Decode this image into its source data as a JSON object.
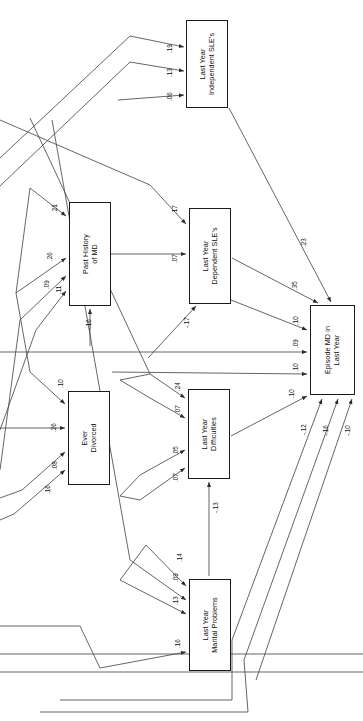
{
  "figure": {
    "orientation": "rotated-90-ccw",
    "type": "path-diagram",
    "background": "#ffffff",
    "line_color": "#3a3a3a",
    "box_border": "#1a1a1a"
  },
  "nodes": [
    {
      "id": "independent_sle",
      "line1": "Last Year",
      "line2": "Independent SLE's",
      "x": 186,
      "y": 20,
      "w": 42,
      "h": 88
    },
    {
      "id": "past_md",
      "line1": "Past History",
      "line2": "of MD",
      "x": 69,
      "y": 202,
      "w": 42,
      "h": 104
    },
    {
      "id": "dependent_sle",
      "line1": "Last Year",
      "line2": "Dependent SLE's",
      "x": 189,
      "y": 208,
      "w": 42,
      "h": 96
    },
    {
      "id": "episode_md",
      "line1": "Episode MD in",
      "line2": "Last Year",
      "x": 310,
      "y": 305,
      "w": 45,
      "h": 90
    },
    {
      "id": "ever_divorced",
      "line1": "Ever",
      "line2": "Divorced",
      "x": 68,
      "y": 391,
      "w": 42,
      "h": 94
    },
    {
      "id": "difficulties",
      "line1": "Last Year",
      "line2": "Difficulties",
      "x": 188,
      "y": 389,
      "w": 42,
      "h": 90
    },
    {
      "id": "marital",
      "line1": "Last Year",
      "line2": "Marital Problems",
      "x": 189,
      "y": 579,
      "w": 42,
      "h": 92
    }
  ],
  "chart_data": {
    "type": "diagram",
    "title": "",
    "paths": [
      {
        "to": "independent_sle",
        "coefficient": ".19"
      },
      {
        "to": "independent_sle",
        "coefficient": ".13"
      },
      {
        "to": "independent_sle",
        "coefficient": ".06"
      },
      {
        "to": "past_md",
        "coefficient": ".21"
      },
      {
        "to": "past_md",
        "coefficient": ".26"
      },
      {
        "to": "past_md",
        "coefficient": ".09"
      },
      {
        "to": "past_md",
        "coefficient": ".11"
      },
      {
        "to": "past_md",
        "coefficient": "-.16"
      },
      {
        "from": "past_md",
        "to": "dependent_sle",
        "coefficient": ".07"
      },
      {
        "to": "dependent_sle",
        "coefficient": ".17"
      },
      {
        "to": "dependent_sle",
        "coefficient": "-.17"
      },
      {
        "to": "ever_divorced",
        "coefficient": ".10"
      },
      {
        "to": "ever_divorced",
        "coefficient": ".26"
      },
      {
        "to": "ever_divorced",
        "coefficient": ".08"
      },
      {
        "to": "ever_divorced",
        "coefficient": ".16"
      },
      {
        "to": "difficulties",
        "coefficient": ".24"
      },
      {
        "to": "difficulties",
        "coefficient": ".07"
      },
      {
        "to": "difficulties",
        "coefficient": ".05"
      },
      {
        "to": "difficulties",
        "coefficient": ".07"
      },
      {
        "from": "marital",
        "to": "difficulties",
        "coefficient": "-.13"
      },
      {
        "to": "marital",
        "coefficient": ".14"
      },
      {
        "to": "marital",
        "coefficient": ".09"
      },
      {
        "to": "marital",
        "coefficient": ".13"
      },
      {
        "to": "marital",
        "coefficient": ".16"
      },
      {
        "from": "independent_sle",
        "to": "episode_md",
        "coefficient": ".23"
      },
      {
        "from": "dependent_sle",
        "to": "episode_md",
        "coefficient": ".35"
      },
      {
        "to": "episode_md",
        "coefficient": ".10"
      },
      {
        "to": "episode_md",
        "coefficient": ".09"
      },
      {
        "to": "episode_md",
        "coefficient": ".10"
      },
      {
        "to": "episode_md",
        "coefficient": ".10"
      },
      {
        "to": "episode_md",
        "coefficient": "-.12"
      },
      {
        "to": "episode_md",
        "coefficient": "-.16"
      },
      {
        "to": "episode_md",
        "coefficient": "-.10"
      }
    ]
  },
  "coefficients": [
    {
      "id": "c_isle_19",
      "text": ".19",
      "x": 166,
      "y": 53,
      "rot": -90
    },
    {
      "id": "c_isle_13",
      "text": ".13",
      "x": 166,
      "y": 77,
      "rot": -90
    },
    {
      "id": "c_isle_06",
      "text": ".06",
      "x": 166,
      "y": 101,
      "rot": -90
    },
    {
      "id": "c_pmd_21",
      "text": ".21",
      "x": 51,
      "y": 213,
      "rot": -90
    },
    {
      "id": "c_pmd_26",
      "text": ".26",
      "x": 46,
      "y": 261,
      "rot": -90
    },
    {
      "id": "c_pmd_09",
      "text": ".09",
      "x": 43,
      "y": 289,
      "rot": -90
    },
    {
      "id": "c_pmd_11",
      "text": ".11",
      "x": 55,
      "y": 294,
      "rot": -90
    },
    {
      "id": "c_pmd_16",
      "text": "-.16",
      "x": 85,
      "y": 330,
      "rot": -90
    },
    {
      "id": "c_dsle_17",
      "text": ".17",
      "x": 171,
      "y": 214,
      "rot": -90
    },
    {
      "id": "c_dsle_07",
      "text": ".07",
      "x": 171,
      "y": 263,
      "rot": -90
    },
    {
      "id": "c_dsle_n17",
      "text": "-.17",
      "x": 183,
      "y": 328,
      "rot": -90
    },
    {
      "id": "c_div_10",
      "text": ".10",
      "x": 57,
      "y": 388,
      "rot": -90
    },
    {
      "id": "c_div_26",
      "text": ".26",
      "x": 50,
      "y": 432,
      "rot": -90
    },
    {
      "id": "c_div_08",
      "text": ".08",
      "x": 51,
      "y": 470,
      "rot": -90
    },
    {
      "id": "c_div_16",
      "text": ".16",
      "x": 44,
      "y": 494,
      "rot": -90
    },
    {
      "id": "c_dif_24",
      "text": ".24",
      "x": 174,
      "y": 391,
      "rot": -90
    },
    {
      "id": "c_dif_07a",
      "text": ".07",
      "x": 174,
      "y": 414,
      "rot": -90
    },
    {
      "id": "c_dif_05",
      "text": ".05",
      "x": 172,
      "y": 455,
      "rot": -90
    },
    {
      "id": "c_dif_07b",
      "text": ".07",
      "x": 172,
      "y": 482,
      "rot": -90
    },
    {
      "id": "c_dif_n13",
      "text": "-.13",
      "x": 212,
      "y": 513,
      "rot": -90
    },
    {
      "id": "c_mar_14",
      "text": ".14",
      "x": 176,
      "y": 562,
      "rot": -90
    },
    {
      "id": "c_mar_09",
      "text": ".09",
      "x": 172,
      "y": 582,
      "rot": -90
    },
    {
      "id": "c_mar_13",
      "text": ".13",
      "x": 172,
      "y": 605,
      "rot": -90
    },
    {
      "id": "c_mar_16",
      "text": ".16",
      "x": 174,
      "y": 648,
      "rot": -90
    },
    {
      "id": "c_emd_23",
      "text": ".23",
      "x": 300,
      "y": 247,
      "rot": -90
    },
    {
      "id": "c_emd_35",
      "text": ".35",
      "x": 291,
      "y": 290,
      "rot": -90
    },
    {
      "id": "c_emd_10a",
      "text": ".10",
      "x": 292,
      "y": 325,
      "rot": -90
    },
    {
      "id": "c_emd_09",
      "text": ".09",
      "x": 292,
      "y": 348,
      "rot": -90
    },
    {
      "id": "c_emd_10b",
      "text": ".10",
      "x": 292,
      "y": 372,
      "rot": -90
    },
    {
      "id": "c_emd_10c",
      "text": ".10",
      "x": 288,
      "y": 398,
      "rot": -90
    },
    {
      "id": "c_emd_n12",
      "text": "-.12",
      "x": 300,
      "y": 435,
      "rot": -90
    },
    {
      "id": "c_emd_n16",
      "text": "-.16",
      "x": 322,
      "y": 436,
      "rot": -90
    },
    {
      "id": "c_emd_n10",
      "text": "-.10",
      "x": 344,
      "y": 436,
      "rot": -90
    }
  ]
}
